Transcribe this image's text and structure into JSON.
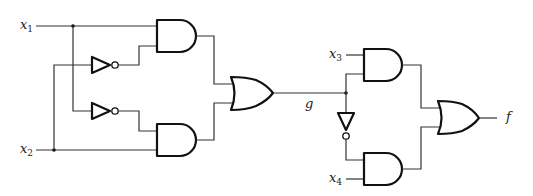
{
  "diagram": {
    "type": "logic-circuit",
    "inputs": [
      {
        "name": "x",
        "sub": "1"
      },
      {
        "name": "x",
        "sub": "2"
      },
      {
        "name": "x",
        "sub": "3"
      },
      {
        "name": "x",
        "sub": "4"
      }
    ],
    "intermediate": {
      "name": "g"
    },
    "output": {
      "name": "f"
    },
    "gates": [
      {
        "id": "NOT1",
        "type": "NOT",
        "input": "x2"
      },
      {
        "id": "NOT2",
        "type": "NOT",
        "input": "x1"
      },
      {
        "id": "AND1",
        "type": "AND",
        "inputs": [
          "x1",
          "NOT1"
        ]
      },
      {
        "id": "AND2",
        "type": "AND",
        "inputs": [
          "NOT2",
          "x2"
        ]
      },
      {
        "id": "OR1",
        "type": "OR",
        "inputs": [
          "AND1",
          "AND2"
        ],
        "output": "g"
      },
      {
        "id": "NOT3",
        "type": "NOT",
        "input": "g"
      },
      {
        "id": "AND3",
        "type": "AND",
        "inputs": [
          "x3",
          "g"
        ]
      },
      {
        "id": "AND4",
        "type": "AND",
        "inputs": [
          "NOT3",
          "x4"
        ]
      },
      {
        "id": "OR2",
        "type": "OR",
        "inputs": [
          "AND3",
          "AND4"
        ],
        "output": "f"
      }
    ],
    "colors": {
      "line": "#111111",
      "background": "#ffffff"
    }
  }
}
